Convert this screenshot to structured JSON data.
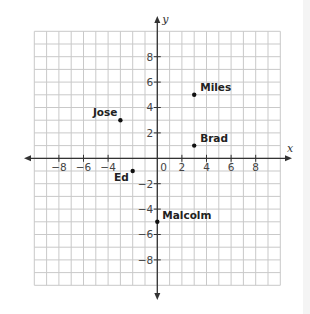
{
  "chart_data": {
    "type": "scatter",
    "title": "",
    "xlabel": "x",
    "ylabel": "y",
    "xlim": [
      -10,
      10
    ],
    "ylim": [
      -10,
      10
    ],
    "grid": true,
    "grid_step": 1,
    "x_ticks": [
      -8,
      -6,
      -4,
      2,
      4,
      6,
      8
    ],
    "x_tick_labels": [
      "−8",
      "−6",
      "−4",
      "2",
      "4",
      "6",
      "8"
    ],
    "y_ticks": [
      8,
      6,
      4,
      2,
      -2,
      -4,
      -6,
      -8
    ],
    "y_tick_labels": [
      "8",
      "6",
      "4",
      "2",
      "−2",
      "−4",
      "−6",
      "−8"
    ],
    "origin_label": "0",
    "points": [
      {
        "name": "Miles",
        "x": 3,
        "y": 5
      },
      {
        "name": "Jose",
        "x": -3,
        "y": 3
      },
      {
        "name": "Brad",
        "x": 3,
        "y": 1
      },
      {
        "name": "Ed",
        "x": -2,
        "y": -1
      },
      {
        "name": "Malcolm",
        "x": 0,
        "y": -5
      }
    ],
    "legend": null
  },
  "colors": {
    "grid": "#c9c9c9",
    "axis": "#333333",
    "point": "#111111",
    "label": "#222222"
  }
}
